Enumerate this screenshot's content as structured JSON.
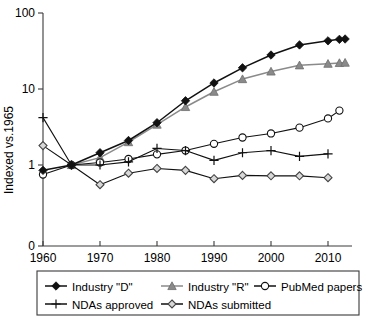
{
  "chart_data": {
    "type": "line",
    "title": "",
    "xlabel": "",
    "ylabel": "Indexed vs.1965",
    "y_scale": "log",
    "ylim": [
      0.4,
      100
    ],
    "xlim": [
      1958,
      2014
    ],
    "grid": false,
    "legend_position": "bottom",
    "x_ticks": [
      "1960",
      "1970",
      "1980",
      "1990",
      "2000",
      "2010"
    ],
    "x_tick_values": [
      1960,
      1970,
      1980,
      1990,
      2000,
      2010
    ],
    "y_ticks": [
      "100",
      "10",
      "1",
      "0"
    ],
    "y_tick_values": [
      100,
      10,
      1,
      0
    ],
    "series": [
      {
        "name": "Industry \"D\"",
        "marker": "filled-diamond",
        "color": "#111111",
        "x": [
          1960,
          1965,
          1970,
          1975,
          1980,
          1985,
          1990,
          1995,
          2000,
          2005,
          2010,
          2012,
          2013
        ],
        "values": [
          0.85,
          1.0,
          1.45,
          2.1,
          3.6,
          7.0,
          12.0,
          19.0,
          28.0,
          38.0,
          43.0,
          45.0,
          45.5
        ]
      },
      {
        "name": "Industry \"R\"",
        "marker": "filled-triangle",
        "color": "#8a8a8a",
        "x": [
          1965,
          1970,
          1975,
          1980,
          1985,
          1990,
          1995,
          2000,
          2005,
          2010,
          2012,
          2013
        ],
        "values": [
          1.0,
          1.25,
          2.0,
          3.4,
          5.8,
          9.2,
          13.5,
          17.0,
          20.5,
          21.5,
          22.0,
          22.2
        ]
      },
      {
        "name": "PubMed papers",
        "marker": "open-circle",
        "color": "#111111",
        "x": [
          1960,
          1965,
          1970,
          1975,
          1980,
          1985,
          1990,
          1995,
          2000,
          2005,
          2010,
          2012
        ],
        "values": [
          0.75,
          1.0,
          1.08,
          1.2,
          1.38,
          1.55,
          1.9,
          2.3,
          2.6,
          3.1,
          4.1,
          5.2
        ]
      },
      {
        "name": "NDAs approved",
        "marker": "plus",
        "color": "#111111",
        "x": [
          1960,
          1965,
          1970,
          1975,
          1980,
          1985,
          1990,
          1995,
          2000,
          2005,
          2010
        ],
        "values": [
          4.2,
          1.0,
          1.0,
          1.1,
          1.65,
          1.55,
          1.15,
          1.45,
          1.55,
          1.3,
          1.4
        ]
      },
      {
        "name": "NDAs submitted",
        "marker": "open-diamond",
        "color": "#111111",
        "x": [
          1960,
          1965,
          1970,
          1975,
          1980,
          1985,
          1990,
          1995,
          2000,
          2005,
          2010
        ],
        "values": [
          1.8,
          1.0,
          0.55,
          0.78,
          0.9,
          0.85,
          0.66,
          0.73,
          0.72,
          0.72,
          0.68
        ]
      }
    ],
    "legend": [
      {
        "label": "Industry \"D\"",
        "marker": "filled-diamond"
      },
      {
        "label": "Industry \"R\"",
        "marker": "filled-triangle"
      },
      {
        "label": "PubMed papers",
        "marker": "open-circle"
      },
      {
        "label": "NDAs approved",
        "marker": "plus"
      },
      {
        "label": "NDAs submitted",
        "marker": "open-diamond"
      }
    ]
  }
}
